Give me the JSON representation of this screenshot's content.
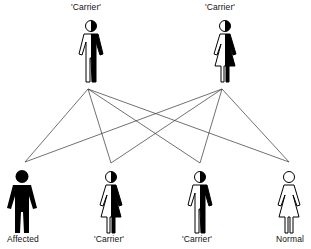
{
  "diagram": {
    "parents": [
      {
        "id": "father",
        "label": "'Carrier'",
        "sex": "male",
        "status": "carrier",
        "x": 88
      },
      {
        "id": "mother",
        "label": "'Carrier'",
        "sex": "female",
        "status": "carrier",
        "x": 222
      }
    ],
    "offspring": [
      {
        "id": "child1",
        "label": "Affected",
        "sex": "male",
        "status": "affected",
        "x": 25
      },
      {
        "id": "child2",
        "label": "'Carrier'",
        "sex": "female",
        "status": "carrier",
        "x": 111
      },
      {
        "id": "child3",
        "label": "'Carrier'",
        "sex": "male",
        "status": "carrier",
        "x": 200
      },
      {
        "id": "child4",
        "label": "Normal",
        "sex": "female",
        "status": "normal",
        "x": 289
      }
    ],
    "connections": [
      [
        "father",
        "child1"
      ],
      [
        "father",
        "child2"
      ],
      [
        "father",
        "child3"
      ],
      [
        "father",
        "child4"
      ],
      [
        "mother",
        "child1"
      ],
      [
        "mother",
        "child2"
      ],
      [
        "mother",
        "child3"
      ],
      [
        "mother",
        "child4"
      ]
    ],
    "colors": {
      "line": "#333333",
      "fill": "#000000",
      "outline": "#000000",
      "background": "#ffffff"
    }
  }
}
